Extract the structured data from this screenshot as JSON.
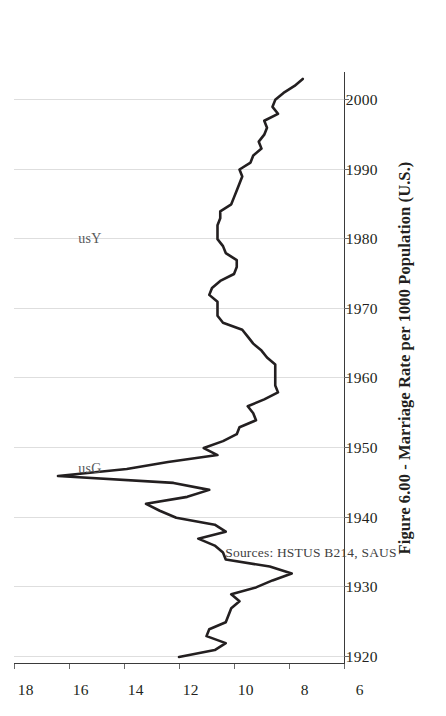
{
  "figure": {
    "title": "Figure 6.00 - Marriage Rate per 1000 Population (U.S.)",
    "source_note": "Sources: HSTUS B214, SAUS",
    "orientation": "page rotated 90 degrees counter-clockwise"
  },
  "annotations": [
    {
      "name": "series-label-usY",
      "text": "usY",
      "x": 1980,
      "y": 15.2
    },
    {
      "name": "series-label-usG",
      "text": "usG",
      "x": 1947,
      "y": 15.2
    }
  ],
  "axis": {
    "y_ticks": [
      "18",
      "16",
      "14",
      "12",
      "10",
      "8",
      "6"
    ],
    "x_ticks": [
      "1920",
      "1930",
      "1940",
      "1950",
      "1960",
      "1970",
      "1980",
      "1990",
      "2000"
    ]
  },
  "chart_data": {
    "type": "line",
    "title": "Figure 6.00 - Marriage Rate per 1000 Population (U.S.)",
    "xlabel": "",
    "ylabel": "Marriage Rate per 1000 Population",
    "xlim": [
      1919,
      2004
    ],
    "ylim": [
      6,
      18
    ],
    "grid": true,
    "legend": "none",
    "series": [
      {
        "name": "usY",
        "color": "#231f20",
        "x": [
          1920,
          1921,
          1922,
          1923,
          1924,
          1925,
          1926,
          1927,
          1928,
          1929,
          1930,
          1931,
          1932,
          1933,
          1934,
          1935,
          1936,
          1937,
          1938,
          1939,
          1940,
          1941,
          1942,
          1943,
          1944,
          1945,
          1946,
          1947,
          1948,
          1949,
          1950,
          1951,
          1952,
          1953,
          1954,
          1955,
          1956,
          1957,
          1958,
          1959,
          1960,
          1961,
          1962,
          1963,
          1964,
          1965,
          1966,
          1967,
          1968,
          1969,
          1970,
          1971,
          1972,
          1973,
          1974,
          1975,
          1976,
          1977,
          1978,
          1979,
          1980,
          1981,
          1982,
          1983,
          1984,
          1985,
          1986,
          1987,
          1988,
          1989,
          1990,
          1991,
          1992,
          1993,
          1994,
          1995,
          1996,
          1997,
          1998,
          1999,
          2000,
          2001,
          2002,
          2003
        ],
        "values": [
          12.0,
          10.7,
          10.3,
          11.0,
          10.9,
          10.3,
          10.2,
          10.1,
          9.8,
          10.1,
          9.2,
          8.6,
          7.9,
          8.7,
          10.3,
          10.4,
          10.7,
          11.3,
          10.3,
          10.7,
          12.1,
          12.7,
          13.2,
          11.7,
          10.9,
          12.2,
          16.4,
          13.9,
          12.4,
          10.6,
          11.1,
          10.4,
          9.9,
          9.8,
          9.2,
          9.3,
          9.5,
          8.9,
          8.4,
          8.5,
          8.5,
          8.5,
          8.5,
          8.8,
          9.0,
          9.3,
          9.5,
          9.7,
          10.4,
          10.6,
          10.6,
          10.6,
          10.9,
          10.8,
          10.5,
          10.0,
          9.9,
          9.9,
          10.3,
          10.4,
          10.6,
          10.6,
          10.6,
          10.5,
          10.5,
          10.1,
          10.0,
          9.9,
          9.8,
          9.7,
          9.8,
          9.4,
          9.3,
          9.0,
          9.1,
          8.9,
          8.8,
          8.9,
          8.4,
          8.6,
          8.5,
          8.2,
          7.8,
          7.5
        ]
      }
    ]
  }
}
